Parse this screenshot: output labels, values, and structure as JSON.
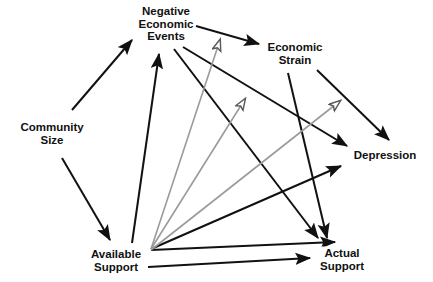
{
  "figure": {
    "type": "path-diagram",
    "background": "#ffffff",
    "width": 433,
    "height": 282,
    "solid_color": "#111111",
    "open_arrow_color": "#9a9a9a"
  },
  "nodes": [
    {
      "id": "community_size",
      "label": "Community\nSize",
      "x": 52,
      "y": 133
    },
    {
      "id": "negative_events",
      "label": "Negative\nEconomic\nEvents",
      "x": 166,
      "y": 24
    },
    {
      "id": "economic_strain",
      "label": "Economic\nStrain",
      "x": 295,
      "y": 53
    },
    {
      "id": "depression",
      "label": "Depression",
      "x": 385,
      "y": 155
    },
    {
      "id": "available_support",
      "label": "Available\nSupport",
      "x": 116,
      "y": 260
    },
    {
      "id": "actual_support",
      "label": "Actual\nSupport",
      "x": 342,
      "y": 259
    }
  ],
  "edges": [
    {
      "id": "e1",
      "from": "community_size",
      "to": "negative_events",
      "style": "solid",
      "head": "filled",
      "x1": 72,
      "y1": 110,
      "x2": 132,
      "y2": 40
    },
    {
      "id": "e2",
      "from": "community_size",
      "to": "available_support",
      "style": "solid",
      "head": "filled",
      "x1": 62,
      "y1": 158,
      "x2": 110,
      "y2": 240
    },
    {
      "id": "e3",
      "from": "negative_events",
      "to": "economic_strain",
      "style": "solid",
      "head": "filled",
      "x1": 196,
      "y1": 26,
      "x2": 259,
      "y2": 44
    },
    {
      "id": "e4",
      "from": "economic_strain",
      "to": "depression",
      "style": "solid",
      "head": "filled",
      "x1": 317,
      "y1": 70,
      "x2": 389,
      "y2": 140
    },
    {
      "id": "e5",
      "from": "economic_strain",
      "to": "actual_support",
      "style": "solid",
      "head": "filled",
      "x1": 288,
      "y1": 73,
      "x2": 327,
      "y2": 238
    },
    {
      "id": "e6",
      "from": "negative_events",
      "to": "depression",
      "style": "solid",
      "head": "filled",
      "x1": 183,
      "y1": 47,
      "x2": 347,
      "y2": 146
    },
    {
      "id": "e7",
      "from": "negative_events",
      "to": "actual_support",
      "style": "solid",
      "head": "filled",
      "x1": 174,
      "y1": 49,
      "x2": 318,
      "y2": 238
    },
    {
      "id": "e8",
      "from": "available_support",
      "to": "negative_events",
      "style": "solid",
      "head": "filled",
      "x1": 132,
      "y1": 243,
      "x2": 159,
      "y2": 54
    },
    {
      "id": "e9",
      "from": "available_support",
      "to": "depression",
      "style": "solid",
      "head": "filled",
      "x1": 151,
      "y1": 249,
      "x2": 341,
      "y2": 166
    },
    {
      "id": "e10",
      "from": "available_support",
      "to": "actual_support",
      "style": "solid",
      "head": "filled",
      "x1": 151,
      "y1": 250,
      "x2": 335,
      "y2": 242
    },
    {
      "id": "e11",
      "from": "available_support",
      "to": "actual_support",
      "style": "solid",
      "head": "filled",
      "x1": 148,
      "y1": 267,
      "x2": 310,
      "y2": 258
    },
    {
      "id": "e12",
      "from": "available_support",
      "to": "events_strain_path",
      "style": "open",
      "head": "open",
      "x1": 151,
      "y1": 249,
      "x2": 220,
      "y2": 40
    },
    {
      "id": "e13",
      "from": "available_support",
      "to": "strain_depr_path",
      "style": "open",
      "head": "open",
      "x1": 151,
      "y1": 249,
      "x2": 245,
      "y2": 99
    },
    {
      "id": "e14",
      "from": "available_support",
      "to": "events_depr_path",
      "style": "open",
      "head": "open",
      "x1": 151,
      "y1": 250,
      "x2": 340,
      "y2": 101
    }
  ]
}
